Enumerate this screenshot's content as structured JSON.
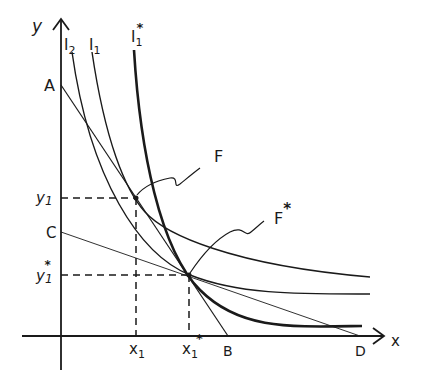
{
  "diagram": {
    "type": "indifference-curve-budget-line-diagram",
    "axes": {
      "x_label": "x",
      "y_label": "y"
    },
    "curves": [
      {
        "id": "I2",
        "label_main": "I",
        "label_sub": "2",
        "label_sup": "",
        "style": "normal"
      },
      {
        "id": "I1",
        "label_main": "I",
        "label_sub": "1",
        "label_sup": "",
        "style": "normal"
      },
      {
        "id": "I1star",
        "label_main": "I",
        "label_sub": "1",
        "label_sup": "*",
        "style": "bold"
      }
    ],
    "budget_lines": [
      {
        "id": "AB",
        "start_label": "A",
        "end_label": "B"
      },
      {
        "id": "CD",
        "start_label": "C",
        "end_label": "D"
      }
    ],
    "points": [
      {
        "id": "F",
        "label_main": "F",
        "label_sup": ""
      },
      {
        "id": "Fstar",
        "label_main": "F",
        "label_sup": "*"
      }
    ],
    "x_ticks": [
      {
        "label_main": "x",
        "label_sub": "1",
        "label_sup": ""
      },
      {
        "label_main": "x",
        "label_sub": "1",
        "label_sup": "*"
      }
    ],
    "y_ticks": [
      {
        "label_main": "y",
        "label_sub": "1",
        "label_sup": ""
      },
      {
        "label_main": "y",
        "label_sub": "1",
        "label_sup": "*"
      }
    ],
    "intercept_labels": {
      "A": "A",
      "B": "B",
      "C": "C",
      "D": "D"
    }
  }
}
